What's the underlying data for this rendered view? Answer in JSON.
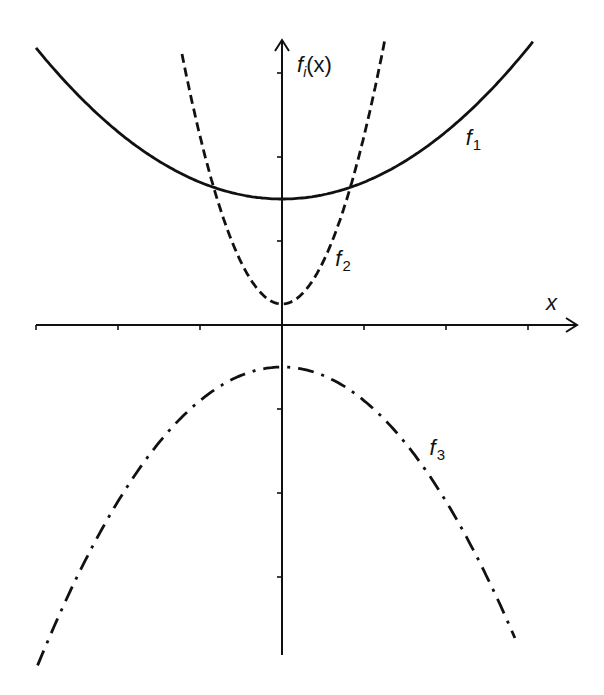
{
  "chart_data": {
    "type": "line",
    "title": "",
    "xlabel": "x",
    "ylabel": "f_i(x)",
    "ylabel_main": "f",
    "ylabel_sub": "i",
    "ylabel_arg": "(x)",
    "xlim": [
      -3,
      3.6
    ],
    "ylim": [
      -3.9,
      3.4
    ],
    "grid": false,
    "legend": "inline labels",
    "x_ticks": [
      -3,
      -2,
      -1,
      0,
      1,
      2,
      3
    ],
    "y_ticks": [
      -3,
      -2,
      -1,
      0,
      1,
      2,
      3
    ],
    "tick_labels_shown": false,
    "series": [
      {
        "name": "f1",
        "label_main": "f",
        "label_sub": "1",
        "style": "solid",
        "formula": "1.5 + 0.2*x^2",
        "a": 0.2,
        "c": 1.5,
        "x_range": [
          -3,
          3.06
        ],
        "label_pos": [
          2.24,
          2.14
        ]
      },
      {
        "name": "f2",
        "label_main": "f",
        "label_sub": "2",
        "style": "dashed",
        "formula": "0.25 + 2*x^2",
        "a": 2.0,
        "c": 0.25,
        "x_range": [
          -1.22,
          1.26
        ],
        "label_pos": [
          0.65,
          0.7
        ]
      },
      {
        "name": "f3",
        "label_main": "f",
        "label_sub": "3",
        "style": "dash-dot",
        "formula": "-0.5 - 0.4*x^2",
        "a": -0.4,
        "c": -0.5,
        "x_range": [
          -2.98,
          2.84
        ],
        "label_pos": [
          1.8,
          -1.55
        ]
      }
    ]
  }
}
